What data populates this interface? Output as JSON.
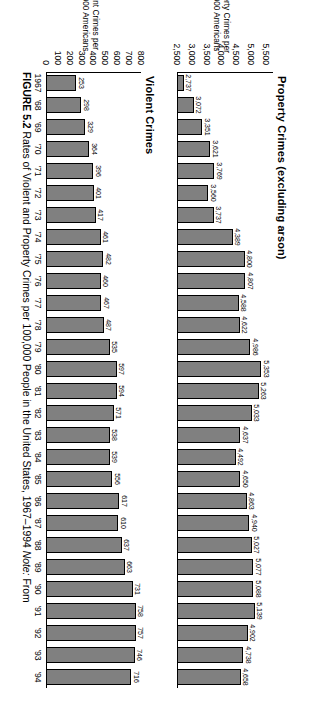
{
  "figure": {
    "caption_label": "FIGURE 5.2",
    "caption_text": "Rates of Violent and Property Crimes per 100,000 People in the United States, 1967–1994",
    "caption_note_label": "Note:",
    "caption_note_text": "From"
  },
  "chart_data": [
    {
      "type": "bar",
      "title": "Property Crimes (excluding arson)",
      "xlabel": "",
      "ylabel": "Property Crimes per\n100,000 Americans",
      "ylim": [
        2500,
        5750
      ],
      "yticks": [
        2500,
        3000,
        3500,
        4000,
        4500,
        5000,
        5500
      ],
      "ytick_labels": [
        "2,500",
        "3,000",
        "3,500",
        "4,000",
        "4,500",
        "5,000",
        "5,500"
      ],
      "grid": false,
      "legend": "none",
      "categories": [
        "1967",
        "'68",
        "'69",
        "'70",
        "'71",
        "'72",
        "'73",
        "'74",
        "'75",
        "'76",
        "'77",
        "'78",
        "'79",
        "'80",
        "'81",
        "'82",
        "'83",
        "'84",
        "'85",
        "'86",
        "'87",
        "'88",
        "'89",
        "'90",
        "'91",
        "'92",
        "'93",
        "'94"
      ],
      "values": [
        2737,
        3072,
        3351,
        3621,
        3769,
        3560,
        3737,
        4389,
        4800,
        4807,
        4588,
        4622,
        4986,
        5353,
        5263,
        5033,
        4637,
        4492,
        4650,
        4863,
        4940,
        5027,
        5077,
        5088,
        5139,
        4902,
        4738,
        4658
      ],
      "value_labels": [
        "2,737",
        "3,072",
        "3,351",
        "3,621",
        "3,769",
        "3,560",
        "3,737",
        "4,389",
        "4,800",
        "4,807",
        "4,588",
        "4,622",
        "4,986",
        "5,353",
        "5,263",
        "5,033",
        "4,637",
        "4,492",
        "4,650",
        "4,863",
        "4,940",
        "5,027",
        "5,077",
        "5,088",
        "5,139",
        "4,902",
        "4,738",
        "4,658"
      ],
      "bar_color": "#808080"
    },
    {
      "type": "bar",
      "title": "Violent Crimes",
      "xlabel": "",
      "ylabel": "Violent Crimes per\n100,000 Americans",
      "ylim": [
        0,
        800
      ],
      "yticks": [
        0,
        100,
        200,
        300,
        400,
        500,
        600,
        700,
        800
      ],
      "ytick_labels": [
        "0",
        "100",
        "200",
        "300",
        "400",
        "500",
        "600",
        "700",
        "800"
      ],
      "grid": false,
      "legend": "none",
      "categories": [
        "1967",
        "'68",
        "'69",
        "'70",
        "'71",
        "'72",
        "'73",
        "'74",
        "'75",
        "'76",
        "'77",
        "'78",
        "'79",
        "'80",
        "'81",
        "'82",
        "'83",
        "'84",
        "'85",
        "'86",
        "'87",
        "'88",
        "'89",
        "'90",
        "'91",
        "'92",
        "'93",
        "'94"
      ],
      "values": [
        253,
        298,
        329,
        364,
        396,
        401,
        417,
        461,
        482,
        460,
        467,
        487,
        535,
        597,
        594,
        571,
        538,
        539,
        556,
        617,
        610,
        637,
        663,
        731,
        758,
        757,
        746,
        716
      ],
      "value_labels": [
        "253",
        "298",
        "329",
        "364",
        "396",
        "401",
        "417",
        "461",
        "482",
        "460",
        "467",
        "487",
        "535",
        "597",
        "594",
        "571",
        "538",
        "539",
        "556",
        "617",
        "610",
        "637",
        "663",
        "731",
        "758",
        "757",
        "746",
        "716"
      ],
      "bar_color": "#808080"
    }
  ]
}
